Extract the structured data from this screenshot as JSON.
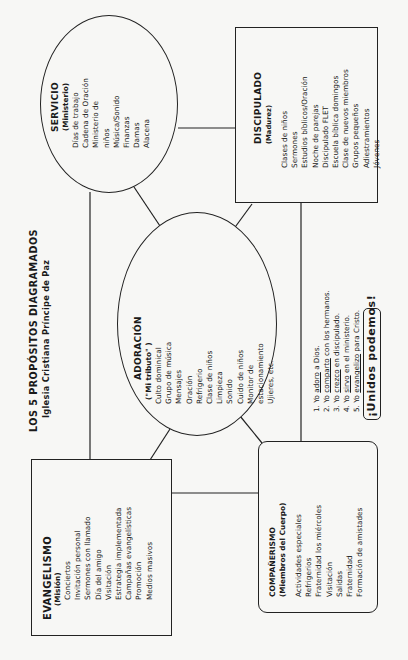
{
  "title": {
    "line1": "LOS 5 PROPÓSITOS DIAGRAMADOS",
    "line2": "Iglesia Cristiana Príncipe de Paz"
  },
  "servicio": {
    "title": "SERVICIO",
    "subtitle": "(Ministerio)",
    "items": [
      "Días de trabajo",
      "Cadena de Oración",
      "Ministerio de",
      "niños",
      "Música/Sonido",
      "Finanzas",
      "Damas",
      "Alacena"
    ]
  },
  "discipulado": {
    "title": "DISCIPULADO",
    "subtitle": "(Madurez)",
    "items": [
      "Clases de niños",
      "Sermones",
      "Estudios bíblicos/Oración",
      "Noche de parejas",
      "Discipulado FLET",
      "Escuela bíblica domingos",
      "Clase de nuevos miembros",
      "Grupos pequeños",
      "Adiestramientos",
      "Jóvenes"
    ]
  },
  "adoracion": {
    "title": "ADORACIÓN",
    "subtitle": "(\"Mi tributo\" )",
    "items": [
      "Culto dominical",
      "Grupo de música",
      "Mensajes",
      "Oración",
      "Refrigerio",
      "Clase de niños",
      "Limpieza",
      "Sonido",
      "Cuido de niños",
      "Monitor de",
      "estacionamiento",
      "Ujieres, etc."
    ]
  },
  "evangelismo": {
    "title": "EVANGELISMO",
    "subtitle": "(Misión)",
    "items": [
      "Conciertos",
      "Invitación personal",
      "Sermones con llamado",
      "Día del amigo",
      "Visitación",
      "Estrategia implementada",
      "Campañas evangelísticas",
      "Promoción",
      "Medios masivos"
    ]
  },
  "companerismo": {
    "title": "COMPAÑERISMO",
    "subtitle": "(Miembros del Cuerpo)",
    "items": [
      "Actividades especiales",
      "Refrigerios",
      "Fraternidad los miércoles",
      "Visitación",
      "Salidas",
      "Fraternidad",
      "Formación de amistades"
    ]
  },
  "steps": [
    {
      "num": "1.",
      "pre": "Yo ",
      "verb": "adoro",
      "post": " a Dios."
    },
    {
      "num": "2.",
      "pre": "Yo ",
      "verb": "comparto",
      "post": " con los hermanos."
    },
    {
      "num": "3.",
      "pre": "Yo ",
      "verb": "crezco",
      "post": " en discipulado."
    },
    {
      "num": "4.",
      "pre": "Yo ",
      "verb": "sirvo",
      "post": " en el ministerio."
    },
    {
      "num": "5.",
      "pre": "Yo ",
      "verb": "evangelizo",
      "post": " para Cristo."
    }
  ],
  "slogan": "¡Unidos podemos!",
  "colors": {
    "ink": "#222222",
    "paper": "#f7f7f5"
  }
}
